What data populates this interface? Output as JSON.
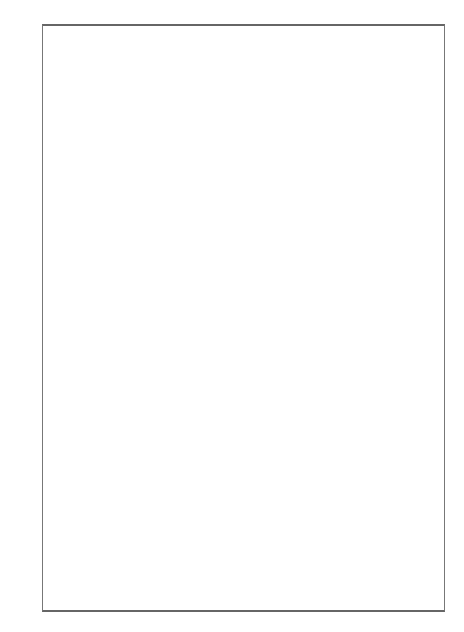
{
  "figure": {
    "lhs_operator": {
      "numerator": "∂",
      "denominator": "∂t"
    },
    "equals": "=",
    "plus": "+",
    "colors": {
      "block": "#555555",
      "line": "#111111",
      "frame": "#777777"
    },
    "diagrams": [
      {
        "id": "lhs",
        "block": {
          "x": 144,
          "y1": 50,
          "y2": 101,
          "top": "σ",
          "mid": "ν",
          "bot": "μ"
        },
        "nodes": [
          {
            "x": 116,
            "y": 54,
            "l": "m"
          },
          {
            "x": 116,
            "y": 75,
            "l": "j"
          },
          {
            "x": 116,
            "y": 94,
            "l": "i"
          }
        ],
        "edges": [
          [
            116,
            54,
            144,
            54
          ],
          [
            116,
            75,
            144,
            75
          ],
          [
            116,
            94,
            144,
            94
          ]
        ],
        "vertices": [],
        "prefix": ""
      },
      {
        "id": "r1a",
        "block": {
          "x": 280,
          "y1": 50,
          "y2": 101,
          "top": "σ",
          "mid": "ν",
          "bot": "μ"
        },
        "nodes": [
          {
            "x": 254,
            "y": 54,
            "l": "m"
          },
          {
            "x": 254,
            "y": 75,
            "l": "j"
          },
          {
            "x": 194,
            "y": 94,
            "l": "i"
          },
          {
            "x": 254,
            "y": 94,
            "l": "k",
            "below": true
          }
        ],
        "edges": [
          [
            254,
            54,
            280,
            54
          ],
          [
            254,
            75,
            280,
            75
          ],
          [
            194,
            94,
            280,
            94
          ]
        ],
        "vertices": [
          {
            "t": "circle",
            "x": 224,
            "y": 94
          }
        ],
        "prefix": "="
      },
      {
        "id": "r1b",
        "block": {
          "x": 418,
          "y1": 50,
          "y2": 101,
          "top": "σ",
          "mid": "ν",
          "bot": "μ"
        },
        "nodes": [
          {
            "x": 392,
            "y": 54,
            "l": "m"
          },
          {
            "x": 329,
            "y": 75,
            "l": "j"
          },
          {
            "x": 392,
            "y": 75,
            "l": "k",
            "below": true
          },
          {
            "x": 392,
            "y": 94,
            "l": "i"
          }
        ],
        "edges": [
          [
            392,
            54,
            418,
            54
          ],
          [
            329,
            75,
            418,
            75
          ],
          [
            392,
            94,
            418,
            94
          ]
        ],
        "vertices": [
          {
            "t": "circle",
            "x": 359,
            "y": 75
          }
        ],
        "prefix": "+"
      },
      {
        "id": "r2a",
        "block": {
          "x": 280,
          "y1": 140,
          "y2": 190,
          "top": "σ",
          "mid": "ν",
          "bot": "μ"
        },
        "nodes": [
          {
            "x": 194,
            "y": 143,
            "l": "m"
          },
          {
            "x": 254,
            "y": 143,
            "l": "k",
            "below": true
          },
          {
            "x": 254,
            "y": 165,
            "l": "j"
          },
          {
            "x": 254,
            "y": 184,
            "l": "i"
          }
        ],
        "edges": [
          [
            194,
            143,
            280,
            143
          ],
          [
            254,
            165,
            280,
            165
          ],
          [
            254,
            184,
            280,
            184
          ]
        ],
        "vertices": [
          {
            "t": "circle",
            "x": 224,
            "y": 143
          }
        ],
        "prefix": "+"
      },
      {
        "id": "r2b",
        "block": {
          "x": 418,
          "y1": 160,
          "y2": 190,
          "top": "",
          "mid": "ν",
          "bot": "μ"
        },
        "nodes": [
          {
            "x": 329,
            "y": 150,
            "l": "m"
          },
          {
            "x": 329,
            "y": 184,
            "l": "i"
          },
          {
            "x": 392,
            "y": 184,
            "l": "k",
            "below": true
          },
          {
            "x": 392,
            "y": 165,
            "l": "j"
          }
        ],
        "edges": [
          [
            329,
            150,
            358,
            182
          ],
          [
            329,
            184,
            418,
            184
          ],
          [
            392,
            165,
            418,
            165
          ]
        ],
        "vertices": [
          {
            "t": "tri",
            "x": 358,
            "y": 184
          }
        ],
        "prefix": "+"
      },
      {
        "id": "r3a",
        "block": {
          "x": 276,
          "y1": 244,
          "y2": 274,
          "top": "",
          "mid": "ν",
          "bot": "μ"
        },
        "nodes": [
          {
            "x": 190,
            "y": 228,
            "l": "m"
          },
          {
            "x": 190,
            "y": 252,
            "l": "j"
          },
          {
            "x": 250,
            "y": 252,
            "l": "k",
            "below": true
          },
          {
            "x": 250,
            "y": 270,
            "l": "i"
          }
        ],
        "edges": [
          [
            190,
            228,
            219,
            250
          ],
          [
            190,
            252,
            276,
            252
          ],
          [
            250,
            270,
            276,
            270
          ]
        ],
        "vertices": [
          {
            "t": "tri",
            "x": 221,
            "y": 252
          }
        ],
        "prefix": "+"
      },
      {
        "id": "r3b",
        "block": {
          "x": 414,
          "y1": 227,
          "y2": 257,
          "top": "σ",
          "mid": "ν",
          "bot": ""
        },
        "nodes": [
          {
            "x": 388,
            "y": 233,
            "l": "m"
          },
          {
            "x": 325,
            "y": 252,
            "l": "j"
          },
          {
            "x": 388,
            "y": 252,
            "l": "k",
            "below": true
          },
          {
            "x": 325,
            "y": 270,
            "l": "i"
          }
        ],
        "edges": [
          [
            388,
            233,
            414,
            233
          ],
          [
            325,
            252,
            414,
            252
          ],
          [
            325,
            270,
            354,
            254
          ]
        ],
        "vertices": [
          {
            "t": "tri",
            "x": 356,
            "y": 252
          }
        ],
        "prefix": "+"
      },
      {
        "id": "r4a",
        "block": {
          "x": 145,
          "y1": 337,
          "y2": 368,
          "top": "σ",
          "mid": "ν",
          "bot": "μ"
        },
        "nodes": [
          {
            "x": 118,
            "y": 345,
            "l": ""
          },
          {
            "x": 60,
            "y": 362,
            "l": "j"
          },
          {
            "x": 118,
            "y": 362,
            "l": "l′",
            "below": true
          },
          {
            "x": 60,
            "y": 381,
            "l": "i"
          },
          {
            "x": 118,
            "y": 381,
            "l": "k′",
            "below": true
          }
        ],
        "edges": [
          [
            118,
            345,
            145,
            345
          ],
          [
            60,
            362,
            145,
            362
          ],
          [
            60,
            381,
            145,
            381
          ]
        ],
        "vertices": [
          {
            "t": "ladder",
            "x": 90,
            "y": 362,
            "y2": 381
          }
        ],
        "prefix": "+",
        "extraBlock": {
          "x": 145,
          "y1": 337,
          "y2": 388
        }
      },
      {
        "id": "r4b",
        "block": {
          "x": 276,
          "y1": 317,
          "y2": 346,
          "top": "σ",
          "mid": "ν",
          "bot": ""
        },
        "nodes": [
          {
            "x": 190,
            "y": 321,
            "l": "m"
          },
          {
            "x": 250,
            "y": 321,
            "l": "k",
            "below": true
          },
          {
            "x": 250,
            "y": 341,
            "l": "j"
          },
          {
            "x": 190,
            "y": 361,
            "l": "i"
          }
        ],
        "edges": [
          [
            190,
            321,
            276,
            321
          ],
          [
            250,
            341,
            276,
            341
          ],
          [
            190,
            361,
            219,
            323
          ]
        ],
        "vertices": [
          {
            "t": "tri",
            "x": 221,
            "y": 321
          }
        ],
        "prefix": "+"
      },
      {
        "id": "r4c",
        "block": {
          "x": 414,
          "y1": 315,
          "y2": 388,
          "top": "σ",
          "mid": "",
          "bot": "μ"
        },
        "nodes": [
          {
            "x": 388,
            "y": 325,
            "l": "m"
          },
          {
            "x": 325,
            "y": 343,
            "l": "j"
          },
          {
            "x": 325,
            "y": 362,
            "l": "i"
          },
          {
            "x": 388,
            "y": 362,
            "l": "k",
            "below": true
          }
        ],
        "edges": [
          [
            388,
            325,
            414,
            325
          ],
          [
            325,
            343,
            354,
            360
          ],
          [
            325,
            362,
            414,
            362
          ]
        ],
        "vertices": [
          {
            "t": "tri",
            "x": 356,
            "y": 362
          }
        ],
        "prefix": "+"
      },
      {
        "id": "r5a",
        "block": {
          "x": 145,
          "y1": 433,
          "y2": 478,
          "top": "σ",
          "mid": "ν",
          "bot": "μ"
        },
        "nodes": [
          {
            "x": 60,
            "y": 437,
            "l": "m"
          },
          {
            "x": 118,
            "y": 437,
            "l": "m′",
            "below": true
          },
          {
            "x": 118,
            "y": 451,
            "l": "j",
            "below": true
          },
          {
            "x": 60,
            "y": 470,
            "l": "i"
          },
          {
            "x": 118,
            "y": 470,
            "l": "k′",
            "below": true
          }
        ],
        "edges": [
          [
            60,
            437,
            145,
            437
          ],
          [
            118,
            451,
            145,
            451
          ],
          [
            60,
            470,
            145,
            470
          ]
        ],
        "vertices": [
          {
            "t": "ladder",
            "x": 90,
            "y": 437,
            "y2": 470
          }
        ],
        "prefix": "+"
      },
      {
        "id": "r5b",
        "block": {
          "x": 276,
          "y1": 433,
          "y2": 478,
          "top": "σ",
          "mid": "",
          "bot": "μ"
        },
        "nodes": [
          {
            "x": 190,
            "y": 437,
            "l": "m"
          },
          {
            "x": 250,
            "y": 437,
            "l": "k",
            "below": true
          },
          {
            "x": 190,
            "y": 451,
            "l": "j"
          },
          {
            "x": 250,
            "y": 470,
            "l": "i"
          }
        ],
        "edges": [
          [
            190,
            437,
            276,
            437
          ],
          [
            190,
            451,
            219,
            439
          ],
          [
            250,
            470,
            276,
            470
          ]
        ],
        "vertices": [
          {
            "t": "tri",
            "x": 221,
            "y": 437
          }
        ],
        "prefix": "+"
      },
      {
        "id": "r5c",
        "block": {
          "x": 414,
          "y1": 408,
          "y2": 478,
          "top": "π",
          "mid": "σ ν",
          "bot": "μ"
        },
        "nodes": [
          {
            "x": 388,
            "y": 413,
            "l": "p"
          },
          {
            "x": 388,
            "y": 452,
            "l": "m",
            "above": true
          },
          {
            "x": 325,
            "y": 471,
            "l": "i"
          },
          {
            "x": 388,
            "y": 471,
            "l": "j",
            "above": true,
            "k": "k"
          }
        ],
        "edges": [
          [
            388,
            413,
            414,
            413
          ],
          [
            388,
            452,
            414,
            452
          ],
          [
            325,
            471,
            414,
            471
          ],
          [
            357,
            469,
            388,
            413
          ]
        ],
        "vertices": [
          {
            "t": "tri",
            "x": 357,
            "y": 471
          }
        ],
        "prefix": "+"
      },
      {
        "id": "r6a",
        "block": {
          "x": 145,
          "y1": 539,
          "y2": 584,
          "top": "σ",
          "mid": "ν",
          "bot": "μ"
        },
        "nodes": [
          {
            "x": 60,
            "y": 544,
            "l": "m"
          },
          {
            "x": 118,
            "y": 544,
            "l": "m′",
            "below": true
          },
          {
            "x": 60,
            "y": 563,
            "l": "j"
          },
          {
            "x": 118,
            "y": 563,
            "l": "l′",
            "below": true
          },
          {
            "x": 118,
            "y": 583,
            "l": "i"
          }
        ],
        "edges": [
          [
            60,
            544,
            145,
            544
          ],
          [
            60,
            563,
            145,
            563
          ],
          [
            118,
            583,
            145,
            583
          ]
        ],
        "vertices": [
          {
            "t": "ladder",
            "x": 90,
            "y": 544,
            "y2": 563
          }
        ],
        "prefix": ""
      },
      {
        "id": "r6b",
        "block": {
          "x": 276,
          "y1": 520,
          "y2": 597,
          "top": "π",
          "mid": "σ ν",
          "bot": "μ"
        },
        "nodes": [
          {
            "x": 250,
            "y": 524,
            "l": "p"
          },
          {
            "x": 250,
            "y": 543,
            "l": "m",
            "below": true
          },
          {
            "x": 190,
            "y": 562,
            "l": "j"
          },
          {
            "x": 250,
            "y": 562,
            "l": "k",
            "below": true
          },
          {
            "x": 250,
            "y": 583,
            "l": "i"
          }
        ],
        "edges": [
          [
            250,
            524,
            276,
            524
          ],
          [
            250,
            543,
            276,
            543
          ],
          [
            190,
            562,
            276,
            562
          ],
          [
            250,
            583,
            276,
            583
          ],
          [
            221,
            560,
            250,
            524
          ]
        ],
        "vertices": [
          {
            "t": "tri",
            "x": 221,
            "y": 562
          }
        ],
        "prefix": "+"
      },
      {
        "id": "r6c",
        "block": {
          "x": 414,
          "y1": 520,
          "y2": 597,
          "top": "π",
          "mid": "σ ν",
          "bot": "μ"
        },
        "nodes": [
          {
            "x": 388,
            "y": 524,
            "l": "p"
          },
          {
            "x": 325,
            "y": 543,
            "l": "m"
          },
          {
            "x": 388,
            "y": 543,
            "l": "k",
            "below": true
          },
          {
            "x": 388,
            "y": 562,
            "l": "j"
          },
          {
            "x": 388,
            "y": 583,
            "l": "i"
          }
        ],
        "edges": [
          [
            388,
            524,
            414,
            524
          ],
          [
            325,
            543,
            414,
            543
          ],
          [
            388,
            562,
            414,
            562
          ],
          [
            388,
            583,
            414,
            583
          ],
          [
            356,
            541,
            388,
            524
          ]
        ],
        "vertices": [
          {
            "t": "tri",
            "x": 356,
            "y": 543
          }
        ],
        "prefix": "+"
      }
    ]
  }
}
